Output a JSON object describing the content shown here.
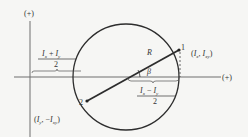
{
  "diagram": {
    "axes": {
      "vertical_label": "(+)",
      "horizontal_label": "(+)"
    },
    "points": [
      {
        "id": "1",
        "label": "1",
        "coords_label": "(I_x, I_xy)"
      },
      {
        "id": "2",
        "label": "2",
        "coords_label": "(I_y, −I_xy)"
      }
    ],
    "radius_label": "R",
    "angle_label": "β",
    "center_distance": {
      "numerator": "I_x + I_y",
      "denominator": "2"
    },
    "half_difference": {
      "numerator": "I_x − I_y",
      "denominator": "2"
    },
    "colors": {
      "line": "#3a3a3a",
      "axis": "#7a7a7a",
      "background": "#f6f6f4"
    }
  }
}
